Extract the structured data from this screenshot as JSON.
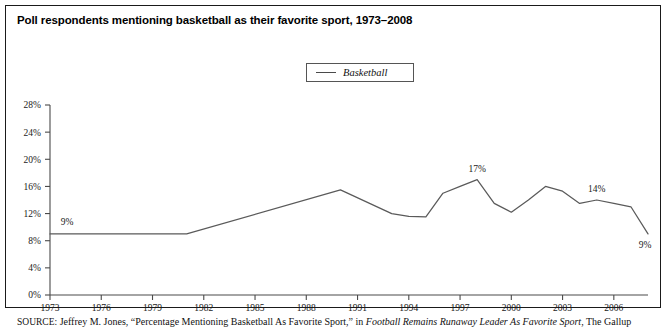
{
  "figure": {
    "title": "Poll respondents mentioning basketball as their favorite sport, 1973–2008",
    "source_kicker": "SOURCE:",
    "source_text_1": " Jeffrey M. Jones, “Percentage Mentioning Basketball As Favorite Sport,” in ",
    "source_italic": "Football Remains Runaway Leader As Favorite Sport",
    "source_text_2": ", The Gallup"
  },
  "legend": {
    "entries": [
      {
        "label": "Basketball",
        "color": "#4a4a4a"
      }
    ]
  },
  "chart_data": {
    "type": "line",
    "title": "Poll respondents mentioning basketball as their favorite sport, 1973–2008",
    "xlabel": "",
    "ylabel": "",
    "xlim": [
      1973,
      2008
    ],
    "ylim": [
      0,
      28
    ],
    "grid": false,
    "legend_position": "top-center",
    "xticks": [
      1973,
      1976,
      1979,
      1982,
      1985,
      1988,
      1991,
      1994,
      1997,
      2000,
      2003,
      2006
    ],
    "xtick_labels": [
      "1973",
      "1976",
      "1979",
      "1982",
      "1985",
      "1988",
      "1991",
      "1994",
      "1997",
      "2000",
      "2003",
      "2006"
    ],
    "yticks": [
      0,
      4,
      8,
      12,
      16,
      20,
      24,
      28
    ],
    "ytick_labels": [
      "0%",
      "4%",
      "8%",
      "12%",
      "16%",
      "20%",
      "24%",
      "28%"
    ],
    "series": [
      {
        "name": "Basketball",
        "color": "#5a5a5a",
        "x": [
          1973,
          1981,
          1990,
          1993,
          1994,
          1995,
          1996,
          1997,
          1998,
          1999,
          2000,
          2001,
          2002,
          2003,
          2004,
          2005,
          2006,
          2007,
          2008
        ],
        "values": [
          9,
          9,
          15.5,
          12,
          11.6,
          11.5,
          15,
          16,
          17,
          13.5,
          12.2,
          14,
          16,
          15.3,
          13.5,
          14,
          13.5,
          13,
          9
        ]
      }
    ],
    "annotations": [
      {
        "text": "9%",
        "x": 1974,
        "y": 9,
        "dx": 0,
        "dy": -9
      },
      {
        "text": "17%",
        "x": 1998,
        "y": 17,
        "dx": 0,
        "dy": -8
      },
      {
        "text": "14%",
        "x": 2005,
        "y": 14,
        "dx": 0,
        "dy": -8
      },
      {
        "text": "9%",
        "x": 2008,
        "y": 9,
        "dx": -3,
        "dy": 14
      }
    ]
  }
}
